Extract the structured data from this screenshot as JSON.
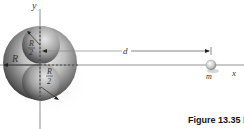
{
  "figure": {
    "labels": {
      "y_axis": "y",
      "x_axis": "x",
      "big_radius": "R",
      "small_radius_num": "R",
      "small_radius_den": "2",
      "distance": "d",
      "mass": "m"
    },
    "caption": {
      "prefix": "Figure 13.35",
      "rest": " P"
    },
    "colors": {
      "sphere_dark": "#3a3a3a",
      "sphere_light": "#e8e8e8",
      "axis": "#777777"
    }
  }
}
